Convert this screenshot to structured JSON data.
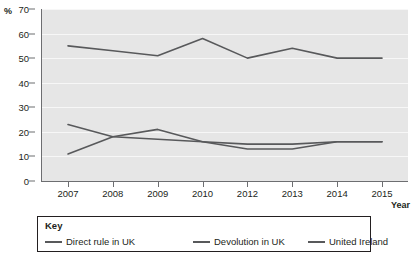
{
  "chart_data": {
    "type": "line",
    "title": "",
    "xlabel": "Year",
    "ylabel": "%",
    "categories": [
      "2007",
      "2008",
      "2009",
      "2010",
      "2012",
      "2013",
      "2014",
      "2015"
    ],
    "ylim": [
      0,
      70
    ],
    "ytick_step": 10,
    "yticks": [
      "70",
      "60",
      "50",
      "40",
      "30",
      "20",
      "10",
      "0"
    ],
    "grid": true,
    "legend_position": "bottom",
    "legend_title": "Key",
    "series": [
      {
        "name": "Direct rule in UK",
        "color": "#58595b",
        "values": [
          23,
          18,
          17,
          16,
          15,
          15,
          16,
          16
        ]
      },
      {
        "name": "Devolution in UK",
        "color": "#58595b",
        "values": [
          11,
          18,
          21,
          16,
          13,
          13,
          16,
          16
        ]
      },
      {
        "name": "United Ireland",
        "color": "#58595b",
        "values": [
          55,
          53,
          51,
          58,
          50,
          54,
          50,
          50
        ]
      }
    ]
  },
  "axes": {
    "y_unit_label": "%",
    "x_title": "Year"
  },
  "legend": {
    "title": "Key",
    "items": [
      {
        "label": "Direct rule in UK"
      },
      {
        "label": "Devolution in UK"
      },
      {
        "label": "United Ireland"
      }
    ]
  },
  "colors": {
    "plot_background": "#e6e6e6",
    "gridline": "#f7f7f7",
    "axis": "#6d6e71",
    "line": "#58595b",
    "text": "#231f20",
    "legend_border": "#231f20"
  }
}
